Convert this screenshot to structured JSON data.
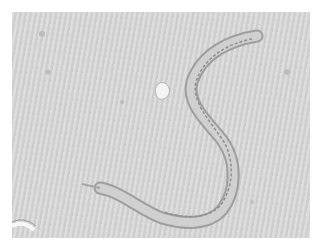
{
  "image": {
    "subject": "nematode under brightfield microscope",
    "background_color": "#d6d6d6",
    "specimen_color": "#a8a8a8"
  }
}
